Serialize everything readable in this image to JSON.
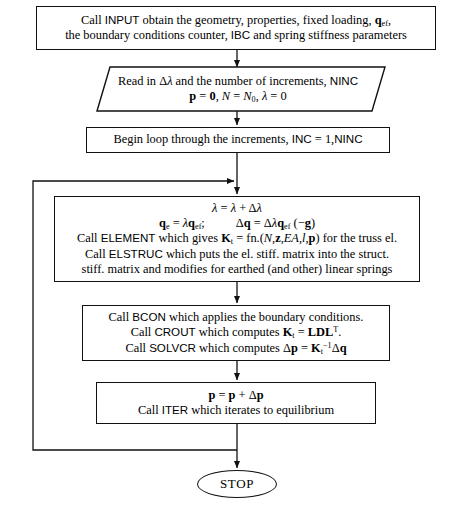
{
  "diagram": {
    "stroke_color": "#111111",
    "background_color": "#ffffff"
  },
  "nodes": {
    "input": {
      "shape": "process",
      "lines": [
        "Call INPUT obtain the geometry, properties, fixed loading, q_ef,",
        "the boundary conditions counter, IBC and spring stiffness parameters"
      ]
    },
    "read": {
      "shape": "parallelogram",
      "lines": [
        "Read in Δλ and the number of increments, NINC",
        "p = 0, N = N₀, λ = 0"
      ]
    },
    "begin_loop": {
      "shape": "process",
      "lines": [
        "Begin loop through the increments, INC = 1,NINC"
      ]
    },
    "lambda_step": {
      "shape": "process",
      "lines": [
        "λ = λ + Δλ",
        "q_e = λq_ef;        Δq = Δλq_ef (−g)",
        "Call ELEMENT which gives K_t = fn.(N,z,EA,l,p) for the truss el.",
        "Call ELSTRUC which puts the el. stiff. matrix into the struct.",
        "stiff. matrix and modifies for earthed (and other) linear springs"
      ]
    },
    "solve": {
      "shape": "process",
      "lines": [
        "Call BCON which applies the boundary conditions.",
        "Call CROUT which computes K_t = LDLᵀ.",
        "Call SOLVCR which computes Δp = K_t⁻¹Δq"
      ]
    },
    "update": {
      "shape": "process",
      "lines": [
        "p = p + Δp",
        "Call ITER which iterates to equilibrium"
      ]
    },
    "stop": {
      "shape": "terminator",
      "label": "STOP"
    }
  },
  "edges": [
    {
      "name": "input-to-read",
      "from": "input",
      "to": "read",
      "arrow": true
    },
    {
      "name": "read-to-begin",
      "from": "read",
      "to": "begin_loop",
      "arrow": true
    },
    {
      "name": "begin-to-lambda",
      "from": "begin_loop",
      "to": "lambda_step",
      "arrow": true
    },
    {
      "name": "lambda-to-solve",
      "from": "lambda_step",
      "to": "solve",
      "arrow": true
    },
    {
      "name": "solve-to-update",
      "from": "solve",
      "to": "update",
      "arrow": true
    },
    {
      "name": "update-to-stop",
      "from": "update",
      "to": "stop",
      "arrow": true
    },
    {
      "name": "increment-loop-back",
      "from": "update",
      "to": "lambda_step",
      "arrow": true,
      "style": "left-feedback-loop"
    }
  ]
}
